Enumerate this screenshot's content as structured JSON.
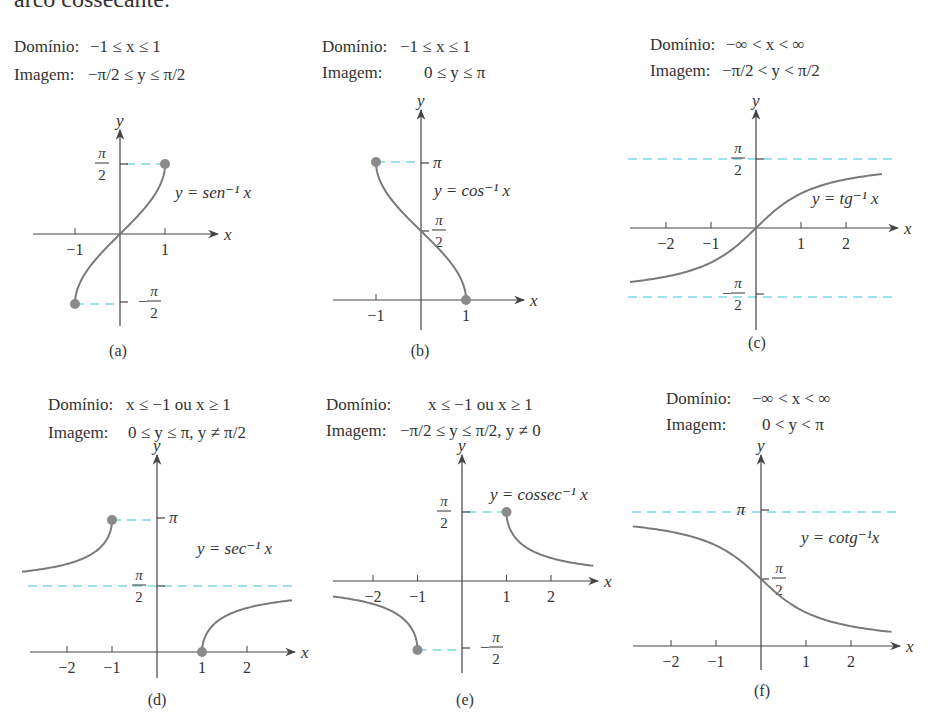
{
  "page": {
    "header_fragment": "arco cossecante."
  },
  "colors": {
    "text": "#333333",
    "axis": "#444444",
    "curve": "#7a7a7a",
    "dot": "#8a8a8a",
    "dashed": "#7fd6e6"
  },
  "panels": [
    {
      "id": "a",
      "caption": "(a)",
      "domain_label": "Domínio:",
      "domain_expr": "−1 ≤ x ≤ 1",
      "range_label": "Imagem:",
      "range_expr": "−π/2 ≤ y ≤ π/2",
      "func_label": "y = sen⁻¹ x",
      "origin": [
        120,
        234
      ],
      "unit_x": 45,
      "x_axis": [
        33,
        218
      ],
      "y_axis": [
        130,
        326
      ],
      "x_ticks": [
        {
          "v": -1,
          "label": "−1"
        },
        {
          "v": 1,
          "label": "1"
        }
      ],
      "y_ticks": [
        {
          "py": 164,
          "label": "π/2",
          "side": "left"
        },
        {
          "py": 302,
          "label": "−π/2",
          "side": "right"
        }
      ]
    },
    {
      "id": "b",
      "caption": "(b)",
      "domain_label": "Domínio:",
      "domain_expr": "−1 ≤ x ≤ 1",
      "range_label": "Imagem:",
      "range_expr": "0 ≤ y ≤ π",
      "func_label": "y = cos⁻¹ x",
      "origin": [
        421,
        300
      ],
      "unit_x": 45,
      "x_axis": [
        333,
        524
      ],
      "y_axis": [
        110,
        330
      ],
      "x_ticks": [
        {
          "v": -1,
          "label": "−1"
        },
        {
          "v": 1,
          "label": "1"
        }
      ],
      "y_ticks": [
        {
          "py": 163,
          "label": "π",
          "side": "right"
        },
        {
          "py": 231,
          "label": "π/2",
          "side": "right"
        }
      ]
    },
    {
      "id": "c",
      "caption": "(c)",
      "domain_label": "Domínio:",
      "domain_expr": "−∞ < x < ∞",
      "range_label": "Imagem:",
      "range_expr": "−π/2 < y < π/2",
      "func_label": "y = tg⁻¹ x",
      "origin": [
        756,
        228
      ],
      "unit_x": 45,
      "x_axis": [
        630,
        898
      ],
      "y_axis": [
        110,
        330
      ],
      "x_ticks": [
        {
          "v": -2,
          "label": "−2"
        },
        {
          "v": -1,
          "label": "−1"
        },
        {
          "v": 1,
          "label": "1"
        },
        {
          "v": 2,
          "label": "2"
        }
      ],
      "y_ticks": [
        {
          "py": 159,
          "label": "π/2",
          "side": "left"
        },
        {
          "py": 294,
          "label": "−π/2",
          "side": "left"
        }
      ]
    },
    {
      "id": "d",
      "caption": "(d)",
      "domain_label": "Domínio:",
      "domain_expr": "x ≤ −1 ou x ≥ 1",
      "range_label": "Imagem:",
      "range_expr": "0 ≤ y ≤ π, y ≠ π/2",
      "func_label": "y = sec⁻¹ x",
      "origin": [
        157,
        652
      ],
      "unit_x": 45,
      "x_axis": [
        30,
        295
      ],
      "y_axis": [
        455,
        678
      ],
      "x_ticks": [
        {
          "v": -2,
          "label": "−2"
        },
        {
          "v": -1,
          "label": "−1"
        },
        {
          "v": 1,
          "label": "1"
        },
        {
          "v": 2,
          "label": "2"
        }
      ],
      "y_ticks": [
        {
          "py": 518,
          "label": "π",
          "side": "right"
        },
        {
          "py": 586,
          "label": "π/2",
          "side": "left"
        }
      ]
    },
    {
      "id": "e",
      "caption": "(e)",
      "domain_label": "Domínio:",
      "domain_expr": "x ≤ −1 ou x ≥ 1",
      "range_label": "Imagem:",
      "range_expr": "−π/2 ≤ y ≤ π/2, y ≠ 0",
      "func_label": "y = cossec⁻¹ x",
      "origin": [
        462,
        581
      ],
      "unit_x": 44.5,
      "x_axis": [
        333,
        598
      ],
      "y_axis": [
        455,
        673
      ],
      "x_ticks": [
        {
          "v": -2,
          "label": "−2"
        },
        {
          "v": -1,
          "label": "−1"
        },
        {
          "v": 1,
          "label": "1"
        },
        {
          "v": 2,
          "label": "2"
        }
      ],
      "y_ticks": [
        {
          "py": 512,
          "label": "π/2",
          "side": "left"
        },
        {
          "py": 648,
          "label": "−π/2",
          "side": "right"
        }
      ]
    },
    {
      "id": "f",
      "caption": "(f)",
      "domain_label": "Domínio:",
      "domain_expr": "−∞ < x < ∞",
      "range_label": "Imagem:",
      "range_expr": "0 < y < π",
      "func_label": "y = cotg⁻¹x",
      "origin": [
        761,
        646
      ],
      "unit_x": 45,
      "x_axis": [
        633,
        900
      ],
      "y_axis": [
        455,
        670
      ],
      "x_ticks": [
        {
          "v": -2,
          "label": "−2"
        },
        {
          "v": -1,
          "label": "−1"
        },
        {
          "v": 1,
          "label": "1"
        },
        {
          "v": 2,
          "label": "2"
        }
      ],
      "y_ticks": [
        {
          "py": 510,
          "label": "π",
          "side": "left"
        },
        {
          "py": 579,
          "label": "π/2",
          "side": "right"
        }
      ]
    }
  ],
  "chart_data": [
    {
      "type": "line",
      "title": "y = sen⁻¹ x",
      "panel": "(a)",
      "xlabel": "x",
      "ylabel": "y",
      "x": [
        -1,
        -0.5,
        0,
        0.5,
        1
      ],
      "y": [
        -1.5708,
        -0.5236,
        0,
        0.5236,
        1.5708
      ],
      "xlim": [
        -1,
        1
      ],
      "ylim": [
        -1.5708,
        1.5708
      ],
      "endpoints_closed": [
        [
          -1,
          -1.5708
        ],
        [
          1,
          1.5708
        ]
      ],
      "annotations": [
        "Domínio: −1 ≤ x ≤ 1",
        "Imagem: −π/2 ≤ y ≤ π/2"
      ]
    },
    {
      "type": "line",
      "title": "y = cos⁻¹ x",
      "panel": "(b)",
      "xlabel": "x",
      "ylabel": "y",
      "x": [
        -1,
        -0.5,
        0,
        0.5,
        1
      ],
      "y": [
        3.1416,
        2.0944,
        1.5708,
        1.0472,
        0
      ],
      "xlim": [
        -1,
        1
      ],
      "ylim": [
        0,
        3.1416
      ],
      "endpoints_closed": [
        [
          -1,
          3.1416
        ],
        [
          1,
          0
        ]
      ],
      "annotations": [
        "Domínio: −1 ≤ x ≤ 1",
        "Imagem: 0 ≤ y ≤ π"
      ]
    },
    {
      "type": "line",
      "title": "y = tg⁻¹ x",
      "panel": "(c)",
      "xlabel": "x",
      "ylabel": "y",
      "x": [
        -2.8,
        -2,
        -1,
        0,
        1,
        2,
        2.8
      ],
      "y": [
        -1.2278,
        -1.1071,
        -0.7854,
        0,
        0.7854,
        1.1071,
        1.2278
      ],
      "asymptotes_y": [
        1.5708,
        -1.5708
      ],
      "annotations": [
        "Domínio: −∞ < x < ∞",
        "Imagem: −π/2 < y < π/2"
      ]
    },
    {
      "type": "line",
      "title": "y = sec⁻¹ x",
      "panel": "(d)",
      "xlabel": "x",
      "ylabel": "y",
      "series": [
        {
          "name": "x ≤ −1",
          "x": [
            -3,
            -2,
            -1.5,
            -1
          ],
          "y": [
            1.9106,
            2.0944,
            2.3005,
            3.1416
          ]
        },
        {
          "name": "x ≥ 1",
          "x": [
            1,
            1.5,
            2,
            3
          ],
          "y": [
            0,
            0.8411,
            1.0472,
            1.231
          ]
        }
      ],
      "asymptotes_y": [
        1.5708
      ],
      "endpoints_closed": [
        [
          -1,
          3.1416
        ],
        [
          1,
          0
        ]
      ],
      "annotations": [
        "Domínio: x ≤ −1 ou x ≥ 1",
        "Imagem: 0 ≤ y ≤ π, y ≠ π/2"
      ]
    },
    {
      "type": "line",
      "title": "y = cossec⁻¹ x",
      "panel": "(e)",
      "xlabel": "x",
      "ylabel": "y",
      "series": [
        {
          "name": "x ≤ −1",
          "x": [
            -3,
            -2,
            -1.5,
            -1
          ],
          "y": [
            -0.3398,
            -0.5236,
            -0.7297,
            -1.5708
          ]
        },
        {
          "name": "x ≥ 1",
          "x": [
            1,
            1.5,
            2,
            3
          ],
          "y": [
            1.5708,
            0.7297,
            0.5236,
            0.3398
          ]
        }
      ],
      "endpoints_closed": [
        [
          1,
          1.5708
        ],
        [
          -1,
          -1.5708
        ]
      ],
      "annotations": [
        "Domínio: x ≤ −1 ou x ≥ 1",
        "Imagem: −π/2 ≤ y ≤ π/2, y ≠ 0"
      ]
    },
    {
      "type": "line",
      "title": "y = cotg⁻¹x",
      "panel": "(f)",
      "xlabel": "x",
      "ylabel": "y",
      "x": [
        -3,
        -2,
        -1,
        0,
        1,
        2,
        3
      ],
      "y": [
        2.8198,
        2.6779,
        2.3562,
        1.5708,
        0.7854,
        0.4636,
        0.3218
      ],
      "asymptotes_y": [
        3.1416
      ],
      "annotations": [
        "Domínio: −∞ < x < ∞",
        "Imagem: 0 < y < π"
      ]
    }
  ]
}
